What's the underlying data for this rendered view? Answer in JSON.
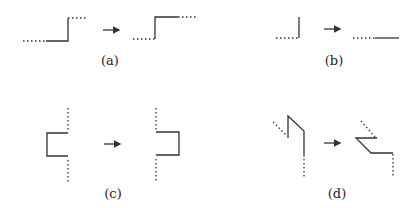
{
  "panels": [
    {
      "id": "a",
      "label": "(a)",
      "description": "step-up corner: dotted left edge, step moves up-left"
    },
    {
      "id": "b",
      "label": "(b)",
      "description": "vertical stub becomes horizontal segment"
    },
    {
      "id": "c",
      "label": "(c)",
      "description": "left-facing notch becomes right-facing notch"
    },
    {
      "id": "d",
      "label": "(d)",
      "description": "zigzag with diagonal becomes flipped diagonal step"
    }
  ],
  "arrow_symbol": "→",
  "colors": {
    "line": "#333333",
    "background": "#ffffff"
  }
}
